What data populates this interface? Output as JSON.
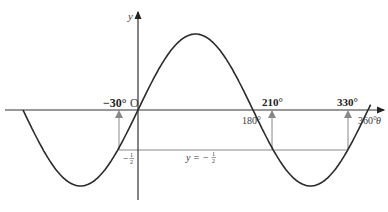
{
  "chart_data": {
    "type": "line",
    "title": "",
    "function": "y = sin θ",
    "xlabel": "θ",
    "ylabel": "y",
    "xlim": [
      -180,
      360
    ],
    "ylim": [
      -1,
      1
    ],
    "horizontal_line": {
      "label": "y = −½",
      "value": -0.5
    },
    "solutions": [
      {
        "label": "−30°",
        "x": -30
      },
      {
        "label": "210°",
        "x": 210
      },
      {
        "label": "330°",
        "x": 330
      }
    ],
    "x_tick_labels": [
      {
        "label": "180°",
        "x": 180
      },
      {
        "label": "360°",
        "x": 360
      }
    ],
    "y_tick_labels": [
      {
        "label": "−½",
        "y": -0.5
      }
    ],
    "origin_label": "O"
  },
  "labels": {
    "y_axis": "y",
    "x_axis": "θ",
    "origin": "O",
    "minus30": "−30°",
    "s210": "210°",
    "s330": "330°",
    "t180": "180°",
    "t360": "360°",
    "minus_half": "−",
    "line_label": "y = −"
  }
}
